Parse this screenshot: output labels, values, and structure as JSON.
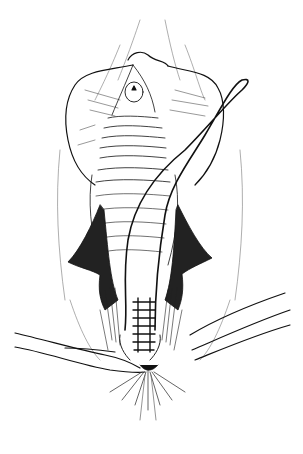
{
  "illustration": {
    "subject": "surgical line drawing",
    "style": "black ink on white",
    "background_color": "#ffffff",
    "ink_color": "#111111",
    "elements": {
      "retracted_tissue": "upper folds",
      "opening": "central cavity with ridged mucosa",
      "suture_loop": "long loop suture upper right",
      "suture_line": "interrupted sutures lower center",
      "suture_threads": "threads extending left and right at bottom"
    }
  }
}
